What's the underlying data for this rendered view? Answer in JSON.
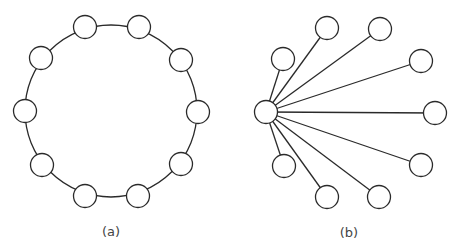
{
  "figure": {
    "panels": [
      {
        "id": "a",
        "caption": "(a)",
        "caption_pos": [
          111,
          231
        ],
        "layout": "ring",
        "ring_center": [
          111,
          111
        ],
        "ring_radius": 86,
        "node_radius": 11.5,
        "nodes": [
          [
            85,
            27
          ],
          [
            139,
            27
          ],
          [
            181,
            60
          ],
          [
            198,
            112
          ],
          [
            181,
            164
          ],
          [
            138,
            196
          ],
          [
            85,
            196
          ],
          [
            42,
            165
          ],
          [
            25,
            111
          ],
          [
            41,
            58
          ]
        ]
      },
      {
        "id": "b",
        "caption": "(b)",
        "caption_pos": [
          349,
          232
        ],
        "layout": "star",
        "hub": [
          266,
          112
        ],
        "node_radius": 11.5,
        "leaves": [
          [
            283,
            59
          ],
          [
            327,
            28
          ],
          [
            380,
            29
          ],
          [
            421,
            61
          ],
          [
            435,
            113
          ],
          [
            421,
            165
          ],
          [
            379,
            197
          ],
          [
            327,
            197
          ],
          [
            284,
            166
          ]
        ]
      }
    ],
    "colors": {
      "stroke": "#2a2a2a",
      "fill": "#ffffff",
      "caption": "#444444"
    }
  }
}
